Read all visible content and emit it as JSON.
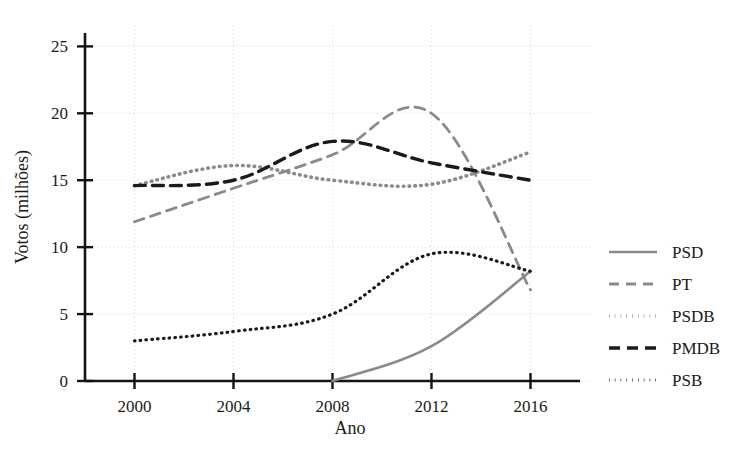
{
  "chart_data": {
    "type": "line",
    "title": "",
    "xlabel": "Ano",
    "ylabel": "Votos (milhões)",
    "x": [
      2000,
      2004,
      2008,
      2012,
      2016
    ],
    "xlim": [
      1998,
      2018
    ],
    "ylim": [
      0,
      26
    ],
    "xticks": [
      "2000",
      "2004",
      "2008",
      "2012",
      "2016"
    ],
    "yticks": [
      "0",
      "5",
      "10",
      "15",
      "20",
      "25"
    ],
    "ytick_values": [
      0,
      5,
      10,
      15,
      20,
      25
    ],
    "grid": true,
    "legend_position": "right",
    "series": [
      {
        "name": "PSD",
        "values": [
          null,
          null,
          0.0,
          2.6,
          8.2
        ],
        "color": "#8a8a8a",
        "style": "solid"
      },
      {
        "name": "PT",
        "values": [
          11.9,
          14.4,
          16.9,
          20.0,
          6.8
        ],
        "color": "#8a8a8a",
        "style": "dashed"
      },
      {
        "name": "PSDB",
        "values": [
          14.6,
          16.1,
          15.0,
          14.7,
          17.1
        ],
        "color": "#8a8a8a",
        "style": "dotted"
      },
      {
        "name": "PMDB",
        "values": [
          14.6,
          15.0,
          17.9,
          16.3,
          15.0
        ],
        "color": "#1a1a1a",
        "style": "dashed"
      },
      {
        "name": "PSB",
        "values": [
          3.0,
          3.7,
          5.0,
          9.5,
          8.2
        ],
        "color": "#1a1a1a",
        "style": "dotted"
      }
    ]
  },
  "legend": {
    "items": [
      {
        "label": "PSD"
      },
      {
        "label": "PT"
      },
      {
        "label": "PSDB"
      },
      {
        "label": "PMDB"
      },
      {
        "label": "PSB"
      }
    ]
  },
  "axes": {
    "x_title": "Ano",
    "y_title": "Votos (milhões)",
    "x_tick_labels": [
      "2000",
      "2004",
      "2008",
      "2012",
      "2016"
    ],
    "y_tick_labels": [
      "0",
      "5",
      "10",
      "15",
      "20",
      "25"
    ]
  }
}
